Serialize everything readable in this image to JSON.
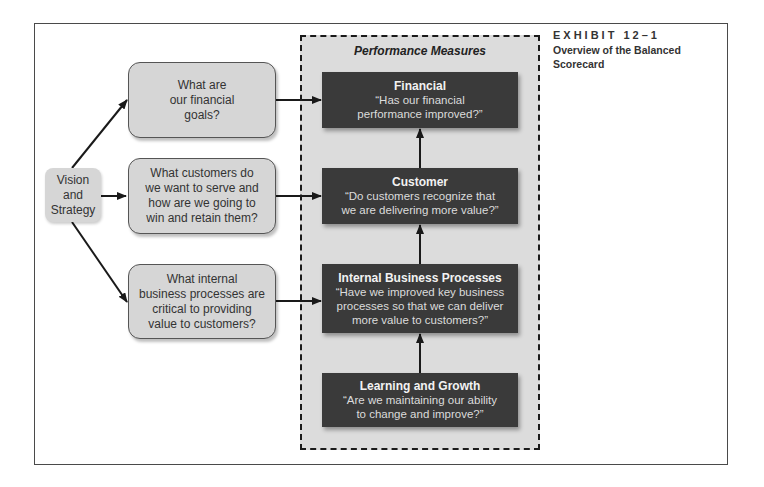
{
  "exhibit": {
    "label": "EXHIBIT 12–1",
    "title": "Overview of the Balanced\nScorecard"
  },
  "vision": {
    "label": "Vision\nand\nStrategy"
  },
  "questions": [
    {
      "id": "financial-question",
      "text": "What are\nour financial\ngoals?"
    },
    {
      "id": "customer-question",
      "text": "What customers do\nwe want to serve and\nhow are we going to\nwin and retain them?"
    },
    {
      "id": "internal-question",
      "text": "What internal\nbusiness processes are\ncritical to providing\nvalue to customers?"
    }
  ],
  "performance_measures": {
    "title": "Performance Measures",
    "boxes": [
      {
        "id": "financial",
        "title": "Financial",
        "question": "“Has our financial\nperformance improved?”"
      },
      {
        "id": "customer",
        "title": "Customer",
        "question": "“Do customers recognize that\nwe are delivering more value?”"
      },
      {
        "id": "internal",
        "title": "Internal Business Processes",
        "question": "“Have we improved key business\nprocesses so that we can deliver\nmore value to customers?”"
      },
      {
        "id": "learning",
        "title": "Learning and Growth",
        "question": "“Are we maintaining our ability\nto change and improve?”"
      }
    ]
  },
  "colors": {
    "panel_bg": "#dcdcdc",
    "question_box_bg": "#d6d6d6",
    "measure_box_bg": "#3a3a3a",
    "arrow": "#1a1a1a"
  }
}
